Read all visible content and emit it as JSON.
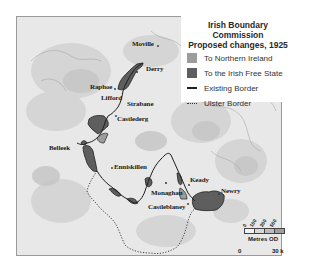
{
  "legend": {
    "title_line1": "Irish Boundary Commission",
    "title_line2": "Proposed changes, 1925",
    "items": [
      {
        "label": "To Northern Ireland",
        "type": "fill",
        "color": "#9c9c9c"
      },
      {
        "label": "To the Irish Free State",
        "type": "fill",
        "color": "#5e5e5e"
      },
      {
        "label": "Existing Border",
        "type": "solid-line",
        "color": "#222222"
      },
      {
        "label": "Ulster Border",
        "type": "dotted-line",
        "color": "#333333"
      }
    ]
  },
  "places": [
    {
      "name": "Moville",
      "x": 127,
      "y": 41
    },
    {
      "name": "Derry",
      "x": 143,
      "y": 69
    },
    {
      "name": "Raphoe",
      "x": 90,
      "y": 86
    },
    {
      "name": "Lifford",
      "x": 102,
      "y": 97
    },
    {
      "name": "Strabane",
      "x": 126,
      "y": 101
    },
    {
      "name": "Castlederg",
      "x": 116,
      "y": 116
    },
    {
      "name": "Belleek",
      "x": 48,
      "y": 145
    },
    {
      "name": "Enniskillen",
      "x": 113,
      "y": 164
    },
    {
      "name": "Monaghan",
      "x": 151,
      "y": 190
    },
    {
      "name": "Castleblaney",
      "x": 146,
      "y": 204
    },
    {
      "name": "Keady",
      "x": 189,
      "y": 177
    },
    {
      "name": "Newry",
      "x": 220,
      "y": 188
    }
  ],
  "scale": {
    "elevation_ticks": [
      "0",
      "100",
      "300",
      "500"
    ],
    "elevation_caption": "Metres OD",
    "distance_start": "0",
    "distance_end": "30 k"
  },
  "colors": {
    "land_light": "#ebebeb",
    "land_mid": "#d6d6d6",
    "land_dark": "#c4c4c4",
    "to_northern_ireland": "#9c9c9c",
    "to_irish_free_state": "#5e5e5e",
    "border": "#1e1e1e"
  }
}
